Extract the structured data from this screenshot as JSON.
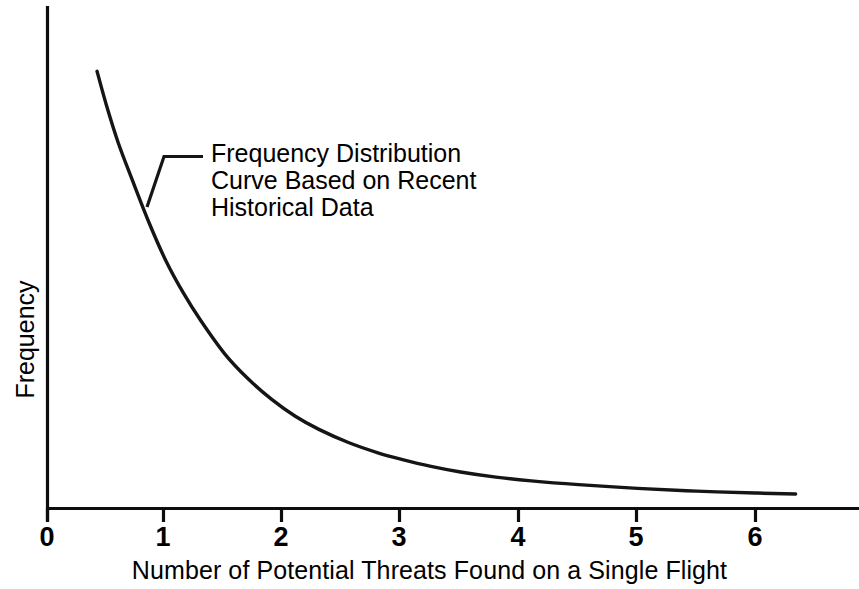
{
  "chart_data": {
    "type": "line",
    "title": "",
    "xlabel": "Number of Potential Threats Found on a Single Flight",
    "ylabel": "Frequency",
    "xlim": [
      0,
      6.88
    ],
    "ylim": [
      0,
      1
    ],
    "grid": false,
    "legend": null,
    "xticks": [
      0,
      1,
      2,
      3,
      4,
      5,
      6
    ],
    "xtick_labels": [
      "0",
      "1",
      "2",
      "3",
      "4",
      "5",
      "6"
    ],
    "yticks": [],
    "ytick_labels": [],
    "series": [
      {
        "name": "Frequency Distribution Curve Based on Recent Historical Data",
        "x": [
          0.42,
          0.5,
          0.6,
          0.72,
          0.86,
          1.0,
          1.15,
          1.3,
          1.5,
          1.7,
          1.9,
          2.1,
          2.3,
          2.55,
          2.8,
          3.0,
          3.25,
          3.5,
          3.8,
          4.1,
          4.5,
          5.0,
          5.5,
          6.0,
          6.34
        ],
        "y": [
          0.933,
          0.86,
          0.78,
          0.7,
          0.61,
          0.53,
          0.46,
          0.4,
          0.33,
          0.276,
          0.232,
          0.196,
          0.168,
          0.14,
          0.118,
          0.104,
          0.089,
          0.077,
          0.066,
          0.058,
          0.05,
          0.042,
          0.036,
          0.032,
          0.03
        ]
      }
    ],
    "annotations": [
      {
        "name": "curve-callout",
        "text_lines": [
          "Frequency Distribution",
          "Curve Based on Recent",
          "Historical Data"
        ],
        "points_to_x": 0.86,
        "points_to_y": 0.61
      }
    ]
  },
  "axis": {
    "x_title": "Number of Potential Threats Found on a Single Flight",
    "y_title": "Frequency",
    "tick_labels": [
      "0",
      "1",
      "2",
      "3",
      "4",
      "5",
      "6"
    ]
  },
  "annotation": {
    "line1": "Frequency Distribution",
    "line2": "Curve Based on Recent",
    "line3": "Historical Data"
  },
  "colors": {
    "curve": "#151515",
    "axis": "#0d0d0d",
    "text": "#000000",
    "background": "#ffffff"
  }
}
